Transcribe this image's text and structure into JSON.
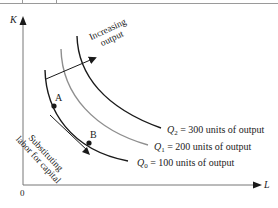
{
  "diagram": {
    "type": "isoquant-map",
    "axes": {
      "y_label": "K",
      "x_label": "L",
      "origin_label": "0"
    },
    "curves": [
      {
        "id": "Q0",
        "label_var": "Q",
        "label_sub": "0",
        "label_text": " = 100 units of output",
        "output": 100,
        "color": "#1a1a1a"
      },
      {
        "id": "Q1",
        "label_var": "Q",
        "label_sub": "1",
        "label_text": " = 200 units of output",
        "output": 200,
        "color": "#8f8f8f"
      },
      {
        "id": "Q2",
        "label_var": "Q",
        "label_sub": "2",
        "label_text": " = 300 units of output",
        "output": 300,
        "color": "#1a1a1a"
      }
    ],
    "points": [
      {
        "label": "A"
      },
      {
        "label": "B"
      }
    ],
    "annotations": {
      "increasing_line1": "Increasing",
      "increasing_line2": "output",
      "substituting_line1": "Substituting",
      "substituting_line2": "labor for capital"
    }
  }
}
